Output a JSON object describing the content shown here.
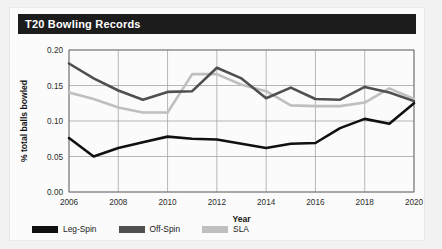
{
  "card": {
    "title": "T20 Bowling Records"
  },
  "legend": {
    "position": "bottom-left",
    "items": [
      {
        "label": "Leg-Spin",
        "color": "#101010"
      },
      {
        "label": "Off-Spin",
        "color": "#4f4f4f"
      },
      {
        "label": "SLA",
        "color": "#bfbfbf"
      }
    ]
  },
  "chart_data": {
    "type": "line",
    "title": "T20 Bowling Records",
    "xlabel": "Year",
    "ylabel": "% total balls bowled",
    "x": [
      2006,
      2007,
      2008,
      2009,
      2010,
      2011,
      2012,
      2013,
      2014,
      2015,
      2016,
      2017,
      2018,
      2019,
      2020
    ],
    "xlim": [
      2006,
      2020
    ],
    "ylim": [
      0.0,
      0.2
    ],
    "xticks": [
      2006,
      2008,
      2010,
      2012,
      2014,
      2016,
      2018,
      2020
    ],
    "yticks": [
      0.0,
      0.05,
      0.1,
      0.15,
      0.2
    ],
    "ytick_labels": [
      "0.00",
      "0.05",
      "0.10",
      "0.15",
      "0.20"
    ],
    "xtick_labels": [
      "2006",
      "2008",
      "2010",
      "2012",
      "2014",
      "2016",
      "2018",
      "2020"
    ],
    "grid": true,
    "series": [
      {
        "name": "Leg-Spin",
        "color": "#101010",
        "values": [
          0.076,
          0.05,
          0.062,
          0.07,
          0.078,
          0.075,
          0.074,
          0.068,
          0.062,
          0.068,
          0.069,
          0.09,
          0.103,
          0.096,
          0.125
        ]
      },
      {
        "name": "Off-Spin",
        "color": "#4f4f4f",
        "values": [
          0.181,
          0.16,
          0.143,
          0.13,
          0.141,
          0.142,
          0.175,
          0.16,
          0.132,
          0.147,
          0.131,
          0.13,
          0.148,
          0.14,
          0.128
        ]
      },
      {
        "name": "SLA",
        "color": "#bfbfbf",
        "values": [
          0.14,
          0.131,
          0.119,
          0.112,
          0.112,
          0.166,
          0.166,
          0.151,
          0.142,
          0.122,
          0.121,
          0.121,
          0.126,
          0.146,
          0.131
        ]
      }
    ]
  }
}
